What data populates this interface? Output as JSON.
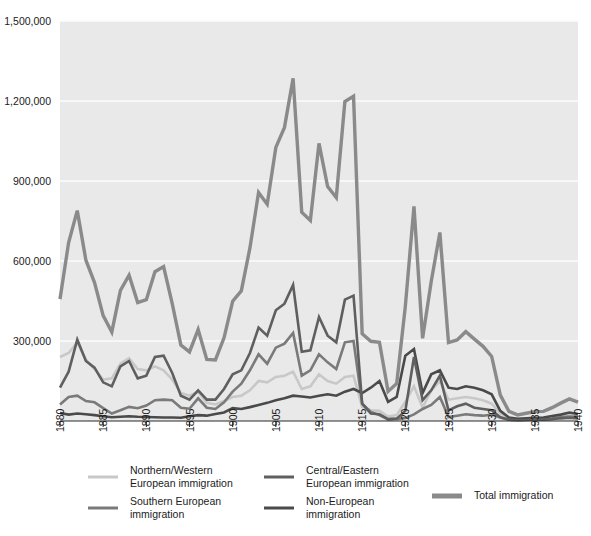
{
  "chart_data": {
    "type": "line",
    "title": "",
    "subtitle": "",
    "xlabel": "",
    "ylabel": "",
    "xlim": [
      1880,
      1940
    ],
    "ylim": [
      0,
      1500000
    ],
    "grid": true,
    "legend_position": "bottom",
    "y_ticks": [
      0,
      300000,
      600000,
      900000,
      1200000,
      1500000
    ],
    "y_tick_labels": [
      "",
      "300,000",
      "600,000",
      "900,000",
      "1,200,000",
      "1,500,000"
    ],
    "x_ticks": [
      1880,
      1885,
      1890,
      1895,
      1900,
      1905,
      1910,
      1915,
      1920,
      1925,
      1930,
      1935,
      1940
    ],
    "x_tick_labels": [
      "1880",
      "1885",
      "1890",
      "1895",
      "1900",
      "1905",
      "1910",
      "1915",
      "1920",
      "1925",
      "1930",
      "1935",
      "1940"
    ],
    "x": [
      1880,
      1881,
      1882,
      1883,
      1884,
      1885,
      1886,
      1887,
      1888,
      1889,
      1890,
      1891,
      1892,
      1893,
      1894,
      1895,
      1896,
      1897,
      1898,
      1899,
      1900,
      1901,
      1902,
      1903,
      1904,
      1905,
      1906,
      1907,
      1908,
      1909,
      1910,
      1911,
      1912,
      1913,
      1914,
      1915,
      1916,
      1917,
      1918,
      1919,
      1920,
      1921,
      1922,
      1923,
      1924,
      1925,
      1926,
      1927,
      1928,
      1929,
      1930,
      1931,
      1932,
      1933,
      1934,
      1935,
      1936,
      1937,
      1938,
      1939,
      1940
    ],
    "series": [
      {
        "name": "Total immigration",
        "color": "#8a8a8a",
        "width": 3.4,
        "values": [
          457000,
          669000,
          789000,
          603000,
          519000,
          395000,
          334000,
          490000,
          547000,
          444000,
          455000,
          560000,
          579000,
          440000,
          285000,
          259000,
          343000,
          231000,
          229000,
          312000,
          449000,
          488000,
          649000,
          857000,
          813000,
          1026000,
          1101000,
          1285000,
          783000,
          752000,
          1041000,
          879000,
          838000,
          1198000,
          1218000,
          327000,
          299000,
          295000,
          111000,
          141000,
          430000,
          805000,
          310000,
          523000,
          707000,
          294000,
          304000,
          335000,
          307000,
          280000,
          242000,
          97000,
          36000,
          23000,
          29000,
          35000,
          36000,
          50000,
          67000,
          83000,
          71000
        ]
      },
      {
        "name": "Northern/Western European immigration",
        "color": "#c8c8c8",
        "width": 2.6,
        "values": [
          240000,
          255000,
          295000,
          230000,
          195000,
          155000,
          160000,
          215000,
          235000,
          195000,
          190000,
          205000,
          190000,
          155000,
          105000,
          95000,
          110000,
          68000,
          62000,
          75000,
          90000,
          95000,
          115000,
          150000,
          145000,
          165000,
          170000,
          185000,
          120000,
          130000,
          175000,
          150000,
          140000,
          165000,
          170000,
          52000,
          40000,
          38000,
          17000,
          22000,
          72000,
          130000,
          50000,
          115000,
          150000,
          80000,
          85000,
          90000,
          85000,
          78000,
          65000,
          28000,
          11000,
          8000,
          9000,
          11000,
          11000,
          14000,
          19000,
          22000,
          20000
        ]
      },
      {
        "name": "Central/Eastern European immigration",
        "color": "#5f5f5f",
        "width": 2.6,
        "values": [
          125000,
          185000,
          305000,
          225000,
          200000,
          145000,
          130000,
          205000,
          225000,
          160000,
          170000,
          240000,
          245000,
          180000,
          95000,
          80000,
          115000,
          80000,
          80000,
          120000,
          175000,
          190000,
          255000,
          350000,
          320000,
          415000,
          440000,
          510000,
          260000,
          265000,
          390000,
          320000,
          295000,
          455000,
          470000,
          65000,
          28000,
          25000,
          7000,
          9000,
          38000,
          240000,
          78000,
          115000,
          170000,
          40000,
          55000,
          65000,
          50000,
          45000,
          40000,
          14000,
          5000,
          3000,
          4000,
          5000,
          5000,
          7000,
          10000,
          12000,
          10000
        ]
      },
      {
        "name": "Southern European immigration",
        "color": "#7a7a7a",
        "width": 2.6,
        "values": [
          62000,
          90000,
          95000,
          75000,
          70000,
          48000,
          28000,
          40000,
          53000,
          48000,
          58000,
          78000,
          80000,
          78000,
          50000,
          46000,
          85000,
          50000,
          45000,
          70000,
          110000,
          140000,
          190000,
          250000,
          215000,
          275000,
          290000,
          330000,
          170000,
          190000,
          250000,
          220000,
          195000,
          295000,
          300000,
          65000,
          34000,
          22000,
          6000,
          8000,
          11000,
          25000,
          45000,
          60000,
          90000,
          15000,
          20000,
          25000,
          22000,
          20000,
          24000,
          13000,
          5000,
          4000,
          5000,
          6000,
          6000,
          9000,
          14000,
          17000,
          15000
        ]
      },
      {
        "name": "Non-European immigration",
        "color": "#4a4a4a",
        "width": 2.6,
        "values": [
          30000,
          24000,
          28000,
          25000,
          22000,
          18000,
          14000,
          16000,
          18000,
          16000,
          15000,
          14000,
          13000,
          13000,
          12000,
          18000,
          22000,
          20000,
          26000,
          32000,
          48000,
          45000,
          52000,
          60000,
          68000,
          78000,
          85000,
          95000,
          92000,
          88000,
          95000,
          100000,
          95000,
          110000,
          120000,
          105000,
          125000,
          150000,
          72000,
          90000,
          245000,
          270000,
          105000,
          175000,
          190000,
          125000,
          120000,
          130000,
          125000,
          115000,
          100000,
          38000,
          13000,
          8000,
          10000,
          12000,
          13000,
          19000,
          24000,
          32000,
          26000
        ]
      }
    ],
    "legend": [
      {
        "id": "northern-western",
        "label_line1": "Northern/Western",
        "label_line2": "European immigration",
        "color": "#c8c8c8",
        "width": 3
      },
      {
        "id": "central-eastern",
        "label_line1": "Central/Eastern",
        "label_line2": "European immigration",
        "color": "#5f5f5f",
        "width": 3
      },
      {
        "id": "total",
        "label_line1": "Total immigration",
        "label_line2": "",
        "color": "#8a8a8a",
        "width": 5
      },
      {
        "id": "southern",
        "label_line1": "Southern European",
        "label_line2": "immigration",
        "color": "#7a7a7a",
        "width": 3
      },
      {
        "id": "non-european",
        "label_line1": "Non-European",
        "label_line2": "immigration",
        "color": "#4a4a4a",
        "width": 3
      }
    ],
    "colors": {
      "plot_background": "#e9e9e9",
      "gridline": "#fbfbfb",
      "axis": "#2b2b2b",
      "page_background": "#ffffff"
    }
  }
}
